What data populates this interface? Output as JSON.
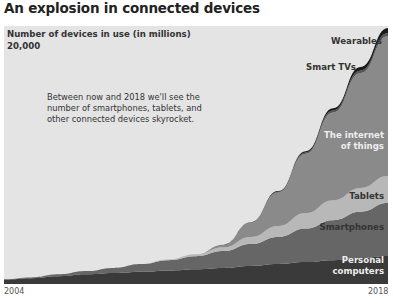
{
  "title": "An explosion in connected devices",
  "annotation": "Between now and 2018 we'll see the number of smartphones, tablets, and other connected devices skyrocket.",
  "colors": {
    "background": "#e4e4e4",
    "personal_computers": "#3a3a3a",
    "smartphones": "#666666",
    "tablets": "#b8b8b8",
    "internet_of_things": "#8a8a8a",
    "smart_tvs": "#555555",
    "wearables": "#1a1a1a"
  },
  "chart_data": {
    "type": "area",
    "stacked": true,
    "title": "An explosion in connected devices",
    "ylabel": "Number of devices in use (in millions)",
    "xlabel": "",
    "x": [
      2004,
      2005,
      2006,
      2007,
      2008,
      2009,
      2010,
      2011,
      2012,
      2013,
      2014,
      2015,
      2016,
      2017,
      2018
    ],
    "x_tick_labels": [
      "2004",
      "2018"
    ],
    "y_tick_labels": [
      "20,000"
    ],
    "ylim": [
      0,
      20000
    ],
    "grid": false,
    "legend": "inline labels at right edge",
    "series": [
      {
        "name": "Personal computers",
        "values": [
          350,
          450,
          600,
          750,
          850,
          950,
          1050,
          1150,
          1250,
          1400,
          1550,
          1700,
          1850,
          2000,
          2170
        ]
      },
      {
        "name": "Smartphones",
        "values": [
          20,
          60,
          150,
          250,
          400,
          600,
          800,
          1000,
          1300,
          1700,
          2100,
          2600,
          3100,
          3600,
          4100
        ]
      },
      {
        "name": "Tablets",
        "values": [
          0,
          0,
          0,
          0,
          0,
          0,
          50,
          150,
          300,
          550,
          850,
          1200,
          1550,
          1850,
          2100
        ]
      },
      {
        "name": "The internet of things",
        "values": [
          0,
          0,
          0,
          0,
          0,
          0,
          0,
          0,
          200,
          1100,
          2600,
          4600,
          6800,
          8900,
          10850
        ]
      },
      {
        "name": "Smart TVs",
        "values": [
          0,
          0,
          0,
          0,
          0,
          0,
          0,
          0,
          0,
          30,
          60,
          100,
          150,
          200,
          230
        ]
      },
      {
        "name": "Wearables",
        "values": [
          0,
          0,
          0,
          0,
          0,
          0,
          0,
          0,
          0,
          10,
          40,
          90,
          170,
          270,
          390
        ]
      }
    ]
  },
  "labels": {
    "wearables": "Wearables",
    "smart_tvs": "Smart TVs",
    "iot_line1": "The internet",
    "iot_line2": "of things",
    "tablets": "Tablets",
    "smartphones": "Smartphones",
    "pc_line1": "Personal",
    "pc_line2": "computers"
  }
}
